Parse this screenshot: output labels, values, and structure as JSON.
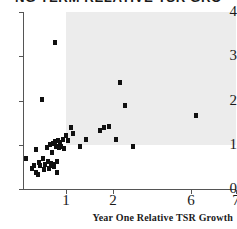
{
  "chart_data": {
    "type": "scatter",
    "title": "NG TERM RELATIVE TSR GRO",
    "xlabel": "Year One Relative TSR Growth",
    "ylabel": "",
    "xticks": [
      1,
      2,
      6,
      7
    ],
    "xtick_labels": [
      "1",
      "2",
      "6",
      "7"
    ],
    "yticks": [
      0,
      1,
      2,
      3,
      4
    ],
    "ytick_labels": [
      "0",
      "1",
      "2",
      "3",
      "4"
    ],
    "xlim": [
      0,
      7
    ],
    "ylim": [
      0,
      4
    ],
    "grid": false,
    "legend": null,
    "note_axis_scale": "x-axis is compressed/broken between 2 and 6",
    "marker": "square",
    "marker_color": "#101010",
    "shaded_region": {
      "x_start": 1.0,
      "x_end": 7.0,
      "y_start": 1.0,
      "y_end": 4.0,
      "color": "#ececec"
    },
    "points": [
      {
        "x": 0.08,
        "y": 0.7
      },
      {
        "x": 0.3,
        "y": 0.9
      },
      {
        "x": 0.22,
        "y": 0.47
      },
      {
        "x": 0.26,
        "y": 0.52
      },
      {
        "x": 0.3,
        "y": 0.38
      },
      {
        "x": 0.34,
        "y": 0.33
      },
      {
        "x": 0.38,
        "y": 0.6
      },
      {
        "x": 0.4,
        "y": 0.52
      },
      {
        "x": 0.44,
        "y": 2.02
      },
      {
        "x": 0.46,
        "y": 0.7
      },
      {
        "x": 0.48,
        "y": 0.44
      },
      {
        "x": 0.52,
        "y": 0.56
      },
      {
        "x": 0.55,
        "y": 0.93
      },
      {
        "x": 0.58,
        "y": 0.63
      },
      {
        "x": 0.6,
        "y": 0.47
      },
      {
        "x": 0.62,
        "y": 1.0
      },
      {
        "x": 0.64,
        "y": 0.58
      },
      {
        "x": 0.66,
        "y": 0.53
      },
      {
        "x": 0.68,
        "y": 0.82
      },
      {
        "x": 0.7,
        "y": 1.02
      },
      {
        "x": 0.7,
        "y": 0.55
      },
      {
        "x": 0.72,
        "y": 0.5
      },
      {
        "x": 0.74,
        "y": 3.3
      },
      {
        "x": 0.75,
        "y": 1.08
      },
      {
        "x": 0.76,
        "y": 0.95
      },
      {
        "x": 0.78,
        "y": 0.62
      },
      {
        "x": 0.8,
        "y": 0.38
      },
      {
        "x": 0.82,
        "y": 1.1
      },
      {
        "x": 0.84,
        "y": 0.93
      },
      {
        "x": 0.86,
        "y": 1.05
      },
      {
        "x": 0.88,
        "y": 0.95
      },
      {
        "x": 0.92,
        "y": 1.12
      },
      {
        "x": 0.95,
        "y": 0.92
      },
      {
        "x": 1.0,
        "y": 1.2
      },
      {
        "x": 1.04,
        "y": 1.1
      },
      {
        "x": 1.1,
        "y": 1.4
      },
      {
        "x": 1.14,
        "y": 1.25
      },
      {
        "x": 1.3,
        "y": 0.95
      },
      {
        "x": 1.42,
        "y": 1.12
      },
      {
        "x": 1.72,
        "y": 1.32
      },
      {
        "x": 1.8,
        "y": 1.38
      },
      {
        "x": 1.92,
        "y": 1.42
      },
      {
        "x": 2.15,
        "y": 1.12
      },
      {
        "x": 2.35,
        "y": 2.4
      },
      {
        "x": 2.62,
        "y": 1.88
      },
      {
        "x": 3.05,
        "y": 0.95
      },
      {
        "x": 6.12,
        "y": 1.67
      }
    ]
  }
}
